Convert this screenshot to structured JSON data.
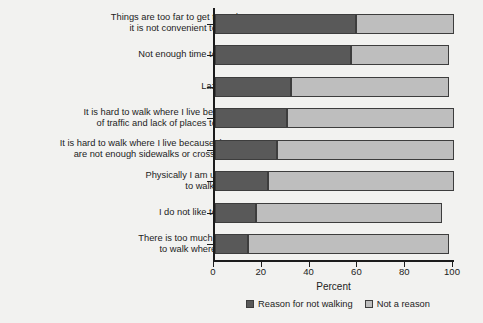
{
  "chart_data": {
    "type": "bar",
    "orientation": "horizontal",
    "stacked": true,
    "title": "",
    "xlabel": "Percent",
    "ylabel": "",
    "xlim": [
      0,
      100
    ],
    "xticks": [
      0,
      20,
      40,
      60,
      80,
      100
    ],
    "grid": false,
    "legend_position": "bottom-center",
    "categories": [
      "Things are too far to get to and\nit is not convenient to walk",
      "Not enough time to walk",
      "Laziness",
      "It is hard to walk where I live because\nof traffic and lack of places to walk",
      "It is hard to walk where I live because there\nare not enough sidewalks or crosswalks",
      "Physically I am unable\nto walk more",
      "I do not like to walk",
      "There is too much crime\nto walk where I live"
    ],
    "series": [
      {
        "name": "Reason for not walking",
        "color": "#595959",
        "values": [
          59,
          57,
          32,
          30,
          26,
          22,
          17,
          14
        ]
      },
      {
        "name": "Not a reason",
        "color": "#bebebe",
        "values": [
          41,
          41,
          66,
          70,
          74,
          78,
          78,
          84
        ]
      }
    ],
    "series_totals": [
      100,
      98,
      98,
      100,
      100,
      100,
      95,
      98
    ]
  },
  "legend": {
    "entries": [
      {
        "label": "Reason for not walking",
        "color": "#595959"
      },
      {
        "label": "Not a reason",
        "color": "#bebebe"
      }
    ]
  },
  "axis": {
    "x_title": "Percent",
    "tick_labels": [
      "0",
      "20",
      "40",
      "60",
      "80",
      "100"
    ]
  },
  "colors": {
    "background": "#f2f2f0",
    "axis": "#1c1c1c",
    "dark_segment": "#595959",
    "light_segment": "#bebebe",
    "segment_border": "#3d3d3d"
  }
}
